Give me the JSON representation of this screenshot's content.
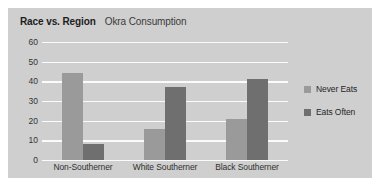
{
  "chart_data": {
    "type": "bar",
    "title": "Race vs. Region",
    "subtitle": "Okra Consumption",
    "xlabel": "",
    "ylabel": "",
    "categories": [
      "Non-Southerner",
      "White Southerner",
      "Black Southerner"
    ],
    "series": [
      {
        "name": "Never Eats",
        "color": "#9a9a9a",
        "values": [
          44,
          16,
          21
        ]
      },
      {
        "name": "Eats Often",
        "color": "#6f6f6f",
        "values": [
          8,
          37,
          41
        ]
      }
    ],
    "yticks": [
      60,
      50,
      40,
      30,
      20,
      10,
      0
    ],
    "ylim": [
      0,
      60
    ],
    "grid": true,
    "legend_position": "right",
    "background_color": "#cfcfcf",
    "gridline_color": "#fbfbfb"
  }
}
